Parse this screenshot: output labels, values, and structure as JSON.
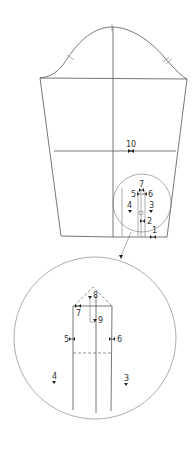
{
  "diagram": {
    "type": "sleeve-pattern",
    "main_view": {
      "labels": [
        {
          "id": "10",
          "text": "10"
        },
        {
          "id": "7",
          "text": "7"
        },
        {
          "id": "5",
          "text": "5"
        },
        {
          "id": "6",
          "text": "6"
        },
        {
          "id": "4",
          "text": "4"
        },
        {
          "id": "3",
          "text": "3"
        },
        {
          "id": "2",
          "text": "2"
        },
        {
          "id": "1",
          "text": "1"
        }
      ]
    },
    "detail_view": {
      "labels": [
        {
          "id": "8",
          "text": "8"
        },
        {
          "id": "7",
          "text": "7"
        },
        {
          "id": "9",
          "text": "9"
        },
        {
          "id": "5",
          "text": "5"
        },
        {
          "id": "6",
          "text": "6"
        },
        {
          "id": "4",
          "text": "4"
        },
        {
          "id": "3",
          "text": "3"
        }
      ]
    },
    "colors": {
      "line": "#555555",
      "background": "#ffffff"
    }
  }
}
